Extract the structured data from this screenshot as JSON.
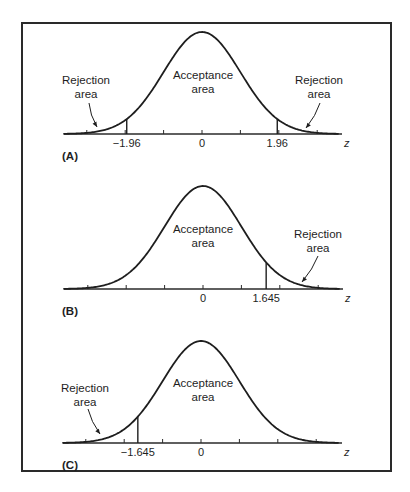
{
  "figure": {
    "frame": {
      "x": 22,
      "y": 23,
      "width": 369,
      "height": 448,
      "stroke": "#2a2a2a"
    },
    "axis_label": "z",
    "line_color": "#1e1e1e",
    "background": "#ffffff"
  },
  "panels": [
    {
      "id": "A",
      "label": "(A)",
      "axis_y": 134,
      "center_x": 202,
      "unit_px": 38.4,
      "peak_height": 102,
      "axis_x_range": [
        64,
        342
      ],
      "tick_positions_z": [
        -3,
        -2,
        -1,
        1,
        2,
        3
      ],
      "critical_values": [
        -1.96,
        1.96
      ],
      "tick_labels": [
        {
          "z": -1.96,
          "text": "−1.96"
        },
        {
          "z": 0,
          "text": "0"
        },
        {
          "z": 1.96,
          "text": "1.96"
        }
      ],
      "acceptance": {
        "line1": "Acceptance",
        "line2": "area",
        "x": 203,
        "y": 79
      },
      "rejection_labels": [
        {
          "line1": "Rejection",
          "line2": "area",
          "x": 86,
          "y": 84,
          "arrow_from": [
            89,
            103
          ],
          "arrow_to": [
            97,
            127
          ]
        },
        {
          "line1": "Rejection",
          "line2": "area",
          "x": 319,
          "y": 84,
          "arrow_from": [
            320,
            103
          ],
          "arrow_to": [
            306,
            128
          ]
        }
      ],
      "test_type": "two-tailed"
    },
    {
      "id": "B",
      "label": "(B)",
      "axis_y": 289,
      "center_x": 203,
      "unit_px": 38.4,
      "peak_height": 103,
      "axis_x_range": [
        64,
        343
      ],
      "tick_positions_z": [
        -3,
        -2,
        -1,
        1,
        2,
        3
      ],
      "critical_values": [
        1.645
      ],
      "tick_labels": [
        {
          "z": 0,
          "text": "0"
        },
        {
          "z": 1.645,
          "text": "1.645"
        }
      ],
      "acceptance": {
        "line1": "Acceptance",
        "line2": "area",
        "x": 203,
        "y": 233
      },
      "rejection_labels": [
        {
          "line1": "Rejection",
          "line2": "area",
          "x": 318,
          "y": 238,
          "arrow_from": [
            318,
            256
          ],
          "arrow_to": [
            302,
            282
          ]
        }
      ],
      "test_type": "right-tailed"
    },
    {
      "id": "C",
      "label": "(C)",
      "axis_y": 443,
      "center_x": 201,
      "unit_px": 38.4,
      "peak_height": 102,
      "axis_x_range": [
        63,
        342
      ],
      "tick_positions_z": [
        -3,
        -2,
        -1,
        1,
        2,
        3
      ],
      "critical_values": [
        -1.645
      ],
      "tick_labels": [
        {
          "z": -1.645,
          "text": "−1.645"
        },
        {
          "z": 0,
          "text": "0"
        }
      ],
      "acceptance": {
        "line1": "Acceptance",
        "line2": "area",
        "x": 203,
        "y": 387
      },
      "rejection_labels": [
        {
          "line1": "Rejection",
          "line2": "area",
          "x": 85,
          "y": 392,
          "arrow_from": [
            88,
            409
          ],
          "arrow_to": [
            100,
            434
          ]
        }
      ],
      "test_type": "left-tailed"
    }
  ]
}
